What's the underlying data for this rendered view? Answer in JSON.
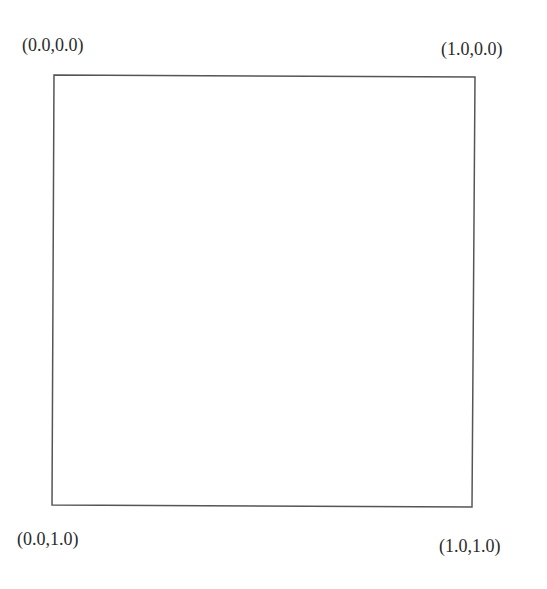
{
  "diagram": {
    "corners": {
      "top_left": {
        "label": "(0.0,0.0)",
        "x": 54,
        "y": 75
      },
      "top_right": {
        "label": "(1.0,0.0)",
        "x": 475,
        "y": 77
      },
      "bottom_left": {
        "label": "(0.0,1.0)",
        "x": 52,
        "y": 505
      },
      "bottom_right": {
        "label": "(1.0,1.0)",
        "x": 472,
        "y": 507
      }
    },
    "stroke_color": "#555555"
  }
}
